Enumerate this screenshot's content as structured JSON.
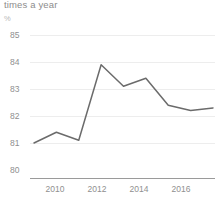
{
  "chart_data": {
    "type": "line",
    "title": "times a year",
    "ylabel": "%",
    "xlabel": "",
    "x": [
      2009,
      2010,
      2011,
      2012,
      2013,
      2014,
      2015,
      2016,
      2017
    ],
    "values": [
      81.0,
      81.4,
      81.1,
      83.9,
      83.1,
      83.4,
      82.4,
      82.2,
      82.3
    ],
    "series": [
      {
        "name": "times a year",
        "values": [
          81.0,
          81.4,
          81.1,
          83.9,
          83.1,
          83.4,
          82.4,
          82.2,
          82.3
        ]
      }
    ],
    "ylim": [
      80,
      85
    ],
    "yticks": [
      80,
      81,
      82,
      83,
      84,
      85
    ],
    "ytick_labels": [
      "80",
      "81",
      "82",
      "83",
      "84",
      "85"
    ],
    "xticks": [
      2010,
      2012,
      2014,
      2016
    ],
    "xtick_labels": [
      "2010",
      "2012",
      "2014",
      "2016"
    ],
    "xlim": [
      2009,
      2017
    ],
    "grid": true,
    "legend": false,
    "line_color": "#6b6b6b",
    "grid_color": "#ededed",
    "axis_color": "#9a9a9a",
    "text_color": "#8f8f8f"
  }
}
